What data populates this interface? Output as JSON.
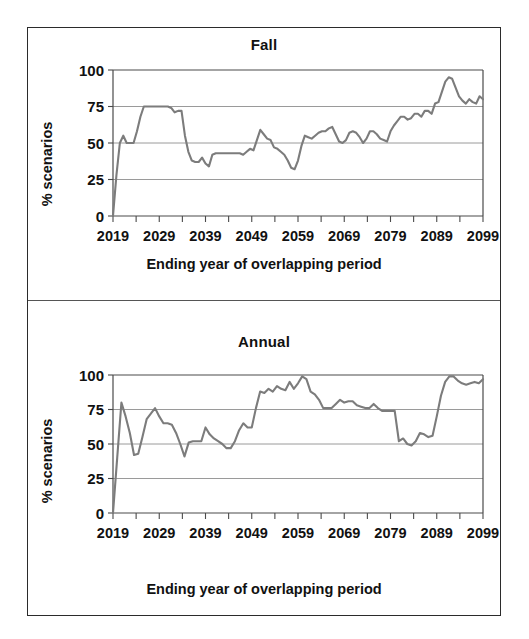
{
  "figure": {
    "panels": [
      {
        "name": "fall",
        "title": "Fall",
        "ylabel": "% scenarios",
        "xlabel": "Ending year of overlapping period"
      },
      {
        "name": "annual",
        "title": "Annual",
        "ylabel": "% scenarios",
        "xlabel": "Ending year of overlapping period"
      }
    ],
    "line_color": "#7c7c7c",
    "grid_color": "#9a9a9a",
    "text_color": "#111111"
  },
  "chart_data": [
    {
      "type": "line",
      "title": "Fall",
      "xlabel": "Ending year of overlapping period",
      "ylabel": "% scenarios",
      "ylim": [
        0,
        100
      ],
      "yticks": [
        0,
        25,
        50,
        75,
        100
      ],
      "xlim": [
        2019,
        2099
      ],
      "xticks": [
        2019,
        2029,
        2039,
        2049,
        2059,
        2069,
        2079,
        2089,
        2099
      ],
      "minor_xtick_interval": 5,
      "grid": "horizontal",
      "legend": "none",
      "x": [
        2019,
        2020,
        2021,
        2022,
        2023,
        2024,
        2025,
        2026,
        2027,
        2028,
        2029,
        2030,
        2031,
        2032,
        2033,
        2034,
        2035,
        2036,
        2037,
        2038,
        2039,
        2040,
        2041,
        2042,
        2043,
        2044,
        2045,
        2046,
        2047,
        2048,
        2049,
        2050,
        2051,
        2052,
        2053,
        2054,
        2055,
        2056,
        2057,
        2058,
        2059,
        2060,
        2061,
        2062,
        2063,
        2064,
        2065,
        2066,
        2067,
        2068,
        2069,
        2070,
        2071,
        2072,
        2073,
        2074,
        2075,
        2076,
        2077,
        2078,
        2079,
        2080,
        2081,
        2082,
        2083,
        2084,
        2085,
        2086,
        2087,
        2088,
        2089,
        2090,
        2091,
        2092,
        2093,
        2094,
        2095,
        2096,
        2097,
        2098,
        2099
      ],
      "values": [
        0,
        28,
        50,
        55,
        50,
        50,
        50,
        58,
        68,
        75,
        75,
        75,
        75,
        75,
        75,
        75,
        75,
        74,
        71,
        72,
        72,
        55,
        44,
        38,
        37,
        37,
        40,
        36,
        34,
        42,
        43,
        43,
        43,
        43,
        43,
        43,
        43,
        43,
        42,
        44,
        46,
        45,
        52,
        59,
        56,
        53,
        52,
        47,
        46,
        44,
        42,
        38,
        33,
        32,
        38,
        48,
        55,
        54,
        53,
        55,
        57,
        58,
        58,
        60,
        61,
        56,
        51,
        50,
        52,
        57,
        58,
        57,
        54,
        50,
        53,
        58,
        58,
        56,
        53,
        52,
        51,
        58,
        62,
        65,
        68,
        68,
        66,
        67,
        70,
        70,
        68,
        72,
        72,
        70,
        77,
        78,
        85,
        92,
        95,
        94,
        88,
        82,
        79,
        77,
        80,
        78,
        77,
        82,
        80
      ]
    },
    {
      "type": "line",
      "title": "Annual",
      "xlabel": "Ending year of overlapping period",
      "ylabel": "% scenarios",
      "ylim": [
        0,
        100
      ],
      "yticks": [
        0,
        25,
        50,
        75,
        100
      ],
      "xlim": [
        2019,
        2099
      ],
      "xticks": [
        2019,
        2029,
        2039,
        2049,
        2059,
        2069,
        2079,
        2089,
        2099
      ],
      "minor_xtick_interval": 5,
      "grid": "horizontal",
      "legend": "none",
      "x": [
        2019,
        2020,
        2021,
        2022,
        2023,
        2024,
        2025,
        2026,
        2027,
        2028,
        2029,
        2030,
        2031,
        2032,
        2033,
        2034,
        2035,
        2036,
        2037,
        2038,
        2039,
        2040,
        2041,
        2042,
        2043,
        2044,
        2045,
        2046,
        2047,
        2048,
        2049,
        2050,
        2051,
        2052,
        2053,
        2054,
        2055,
        2056,
        2057,
        2058,
        2059,
        2060,
        2061,
        2062,
        2063,
        2064,
        2065,
        2066,
        2067,
        2068,
        2069,
        2070,
        2071,
        2072,
        2073,
        2074,
        2075,
        2076,
        2077,
        2078,
        2079,
        2080,
        2081,
        2082,
        2083,
        2084,
        2085,
        2086,
        2087,
        2088,
        2089,
        2090,
        2091,
        2092,
        2093,
        2094,
        2095,
        2096,
        2097,
        2098,
        2099
      ],
      "values": [
        0,
        40,
        80,
        70,
        58,
        42,
        43,
        55,
        68,
        72,
        76,
        70,
        65,
        65,
        64,
        58,
        50,
        41,
        51,
        52,
        52,
        52,
        62,
        57,
        54,
        52,
        50,
        47,
        47,
        52,
        60,
        65,
        62,
        62,
        76,
        88,
        87,
        90,
        88,
        92,
        90,
        89,
        95,
        90,
        94,
        99,
        97,
        88,
        86,
        82,
        76,
        76,
        76,
        79,
        82,
        80,
        81,
        81,
        78,
        77,
        76,
        76,
        79,
        76,
        74,
        74,
        74,
        74,
        52,
        54,
        50,
        49,
        52,
        58,
        57,
        55,
        56,
        70,
        85,
        95,
        99,
        99,
        96,
        94,
        93,
        94,
        95,
        94,
        97
      ]
    }
  ]
}
